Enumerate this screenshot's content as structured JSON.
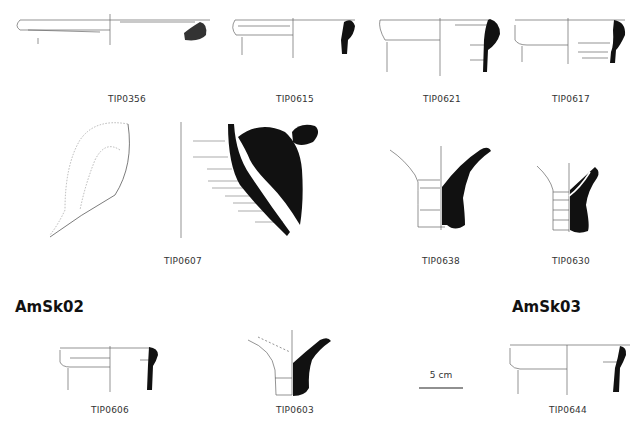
{
  "figure": {
    "sherds": [
      {
        "id": "TIP0356",
        "label": "TIP0356"
      },
      {
        "id": "TIP0615",
        "label": "TIP0615"
      },
      {
        "id": "TIP0621",
        "label": "TIP0621"
      },
      {
        "id": "TIP0617",
        "label": "TIP0617"
      },
      {
        "id": "TIP0607",
        "label": "TIP0607"
      },
      {
        "id": "TIP0638",
        "label": "TIP0638"
      },
      {
        "id": "TIP0630",
        "label": "TIP0630"
      },
      {
        "id": "TIP0606",
        "label": "TIP0606"
      },
      {
        "id": "TIP0603",
        "label": "TIP0603"
      },
      {
        "id": "TIP0644",
        "label": "TIP0644"
      }
    ],
    "groups": [
      {
        "id": "AmSk02",
        "title": "AmSk02"
      },
      {
        "id": "AmSk03",
        "title": "AmSk03"
      }
    ],
    "scale_bar": {
      "label": "5 cm"
    },
    "colors": {
      "profile_fill": "#111111",
      "line": "#555555",
      "faint_line": "#aaaaaa"
    }
  }
}
